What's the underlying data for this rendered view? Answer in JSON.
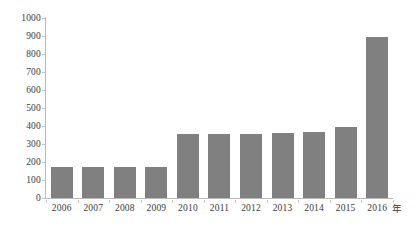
{
  "chart_data": {
    "type": "bar",
    "title": "",
    "subtitle": "",
    "xlabel": "年",
    "ylabel": "",
    "categories": [
      "2006",
      "2007",
      "2008",
      "2009",
      "2010",
      "2011",
      "2012",
      "2013",
      "2014",
      "2015",
      "2016"
    ],
    "values": [
      170,
      172,
      170,
      170,
      355,
      355,
      355,
      362,
      365,
      392,
      895
    ],
    "ylim": [
      0,
      1000
    ],
    "ytick_step": 100,
    "yticks": [
      "0",
      "100",
      "200",
      "300",
      "400",
      "500",
      "600",
      "700",
      "800",
      "900",
      "1000"
    ],
    "grid": false,
    "legend": null,
    "legend_position": "none",
    "series": [
      {
        "name": "",
        "values": [
          170,
          172,
          170,
          170,
          355,
          355,
          355,
          362,
          365,
          392,
          895
        ]
      }
    ],
    "colors": {
      "bar": "#808080",
      "axis": "#b9b9b9",
      "text": "#3a3a3a",
      "background": "#ffffff"
    }
  }
}
